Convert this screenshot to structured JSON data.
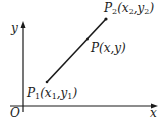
{
  "diagram": {
    "type": "coordinate-plane-segment",
    "axes": {
      "x_label": "x",
      "y_label": "y",
      "origin_label": "O"
    },
    "points": [
      {
        "id": "p1",
        "name": "P",
        "sub": "1",
        "coords": "(x1,y1)",
        "coord_parts": [
          "(x",
          "1",
          ",y",
          "1",
          ")"
        ]
      },
      {
        "id": "p",
        "name": "P",
        "sub": "",
        "coords": "(x,y)"
      },
      {
        "id": "p2",
        "name": "P",
        "sub": "2",
        "coords": "(x2,y2)",
        "coord_parts": [
          "(x",
          "2",
          ",y",
          "2",
          ")"
        ]
      }
    ],
    "segment": {
      "from": "p1",
      "to": "p2",
      "through": "p"
    },
    "colors": {
      "ink": "#1a1a1a",
      "background": "#ffffff"
    }
  }
}
